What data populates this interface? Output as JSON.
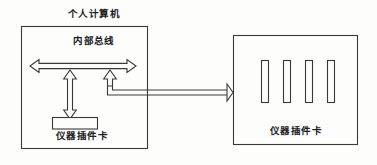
{
  "diagram": {
    "type": "block-diagram",
    "title_pc": "个人计算机",
    "internal_bus_label": "内部总线",
    "internal_card_label": "仪器插件卡",
    "external_card_label": "仪器插件卡",
    "colors": {
      "stroke": "#3a3a3a",
      "background": "#fdfdfc",
      "text": "#20201f"
    },
    "blocks": [
      {
        "name": "personal-computer-enclosure",
        "label": "个人计算机",
        "x": 21,
        "y": 26,
        "width": 126,
        "height": 122
      },
      {
        "name": "internal-instrument-card",
        "label": "仪器插件卡",
        "x": 52,
        "y": 117,
        "width": 45,
        "height": 12
      },
      {
        "name": "external-instrument-chassis",
        "label": "仪器插件卡",
        "x": 233,
        "y": 35,
        "width": 125,
        "height": 110
      }
    ],
    "slots": {
      "name": "chassis-slot-bars",
      "count": 4,
      "x_positions": [
        261,
        283,
        305,
        327
      ],
      "y": 60,
      "width": 7,
      "height": 42
    },
    "connectors": [
      {
        "name": "internal-bus-arrow",
        "style": "double-headed-horizontal",
        "x1": 30,
        "x2": 136,
        "y": 66
      },
      {
        "name": "card-to-bus-arrow",
        "style": "double-headed-vertical",
        "x": 70,
        "y1": 70,
        "y2": 117
      },
      {
        "name": "bus-to-external-connector",
        "style": "single-headed-elbow-right",
        "from_x": 110,
        "from_y": 70,
        "to_x": 233,
        "to_y": 92
      }
    ]
  }
}
